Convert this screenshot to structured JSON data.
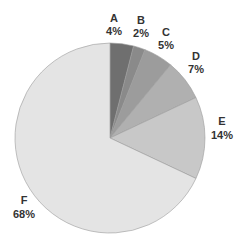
{
  "chart_data": {
    "type": "pie",
    "title": "",
    "categories": [
      "A",
      "B",
      "C",
      "D",
      "E",
      "F"
    ],
    "values": [
      4,
      2,
      5,
      7,
      14,
      68
    ],
    "labels": [
      "4%",
      "2%",
      "5%",
      "7%",
      "14%",
      "68%"
    ],
    "colors": [
      "#6f6f6f",
      "#8a8a8a",
      "#9c9c9c",
      "#b0b0b0",
      "#c8c8c8",
      "#e4e4e4"
    ],
    "start_angle": "12 o'clock",
    "direction": "clockwise",
    "legend": "none (labels placed outside slices)"
  },
  "labels": {
    "A": {
      "name": "A",
      "pct": "4%"
    },
    "B": {
      "name": "B",
      "pct": "2%"
    },
    "C": {
      "name": "C",
      "pct": "5%"
    },
    "D": {
      "name": "D",
      "pct": "7%"
    },
    "E": {
      "name": "E",
      "pct": "14%"
    },
    "F": {
      "name": "F",
      "pct": "68%"
    }
  }
}
